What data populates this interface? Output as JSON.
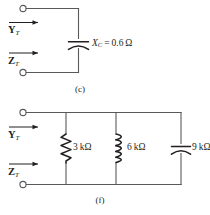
{
  "figure": {
    "background_color": "#ffffff",
    "wire_color": "#58595b",
    "ink_color": "#231f20"
  },
  "circuits": [
    {
      "id": "circuit-c",
      "caption": "(c)",
      "terminal_labels": {
        "top": {
          "symbol": "Y",
          "subscript": "T",
          "name": "admittance-label"
        },
        "bottom": {
          "symbol": "Z",
          "subscript": "T",
          "name": "impedance-label"
        }
      },
      "components": [
        {
          "type": "capacitor",
          "name": "capacitor-xc",
          "symbol": "X",
          "subscript": "C",
          "equals": "=",
          "value": "0.6",
          "unit": "Ω",
          "label": "X_C = 0.6 Ω"
        }
      ]
    },
    {
      "id": "circuit-f",
      "caption": "(f)",
      "terminal_labels": {
        "top": {
          "symbol": "Y",
          "subscript": "T",
          "name": "admittance-label"
        },
        "bottom": {
          "symbol": "Z",
          "subscript": "T",
          "name": "impedance-label"
        }
      },
      "components": [
        {
          "type": "resistor",
          "name": "resistor-3k",
          "value": "3",
          "unit": "kΩ",
          "label": "3 kΩ"
        },
        {
          "type": "inductor",
          "name": "inductor-6k",
          "value": "6",
          "unit": "kΩ",
          "label": "6 kΩ"
        },
        {
          "type": "capacitor",
          "name": "capacitor-9k",
          "value": "9",
          "unit": "kΩ",
          "label": "9 kΩ"
        }
      ]
    }
  ]
}
